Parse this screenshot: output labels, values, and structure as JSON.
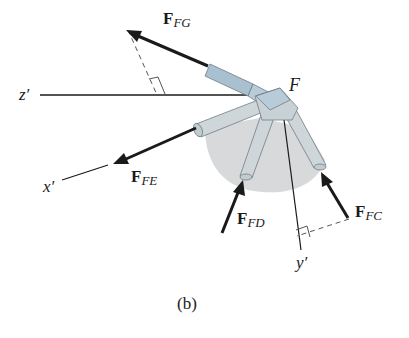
{
  "figure": {
    "caption": "(b)",
    "joint_label": "F",
    "axes": {
      "x": "x′",
      "y": "y′",
      "z": "z′"
    },
    "forces": [
      {
        "id": "FG",
        "symbol": "F",
        "subscript": "FG"
      },
      {
        "id": "FE",
        "symbol": "F",
        "subscript": "FE"
      },
      {
        "id": "FD",
        "symbol": "F",
        "subscript": "FD"
      },
      {
        "id": "FC",
        "symbol": "F",
        "subscript": "FC"
      }
    ],
    "colors": {
      "line": "#1a1a1a",
      "member_highlight": "#a9c0d0",
      "member": "#cfd6da",
      "member_outline": "#6f7d85",
      "shadow": "#d3d5d6",
      "dashed": "#555555"
    }
  }
}
